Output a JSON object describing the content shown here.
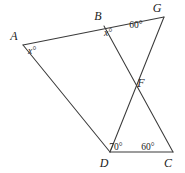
{
  "figure": {
    "background_color": "#ffffff",
    "stroke_color": "#3a3a3a",
    "text_color": "#222222",
    "width": 185,
    "height": 173
  },
  "points": {
    "A": {
      "label": "A",
      "x": 23,
      "y": 45,
      "label_x": 14,
      "label_y": 40
    },
    "B": {
      "label": "B",
      "x": 104,
      "y": 26,
      "label_x": 98,
      "label_y": 20
    },
    "G": {
      "label": "G",
      "x": 164,
      "y": 17,
      "label_x": 157,
      "label_y": 12
    },
    "F": {
      "label": "F",
      "x": 137,
      "y": 82,
      "label_x": 141,
      "label_y": 87
    },
    "D": {
      "label": "D",
      "x": 110,
      "y": 152,
      "label_x": 104,
      "label_y": 167
    },
    "C": {
      "label": "C",
      "x": 173,
      "y": 152,
      "label_x": 168,
      "label_y": 167
    }
  },
  "segments": [
    {
      "name": "segment-A-G",
      "from": "A",
      "to": "G",
      "note": "passes through B"
    },
    {
      "name": "segment-A-D",
      "from": "A",
      "to": "D"
    },
    {
      "name": "segment-B-C",
      "from": "B",
      "to": "C",
      "note": "passes through F"
    },
    {
      "name": "segment-G-D",
      "from": "G",
      "to": "D",
      "note": "passes through F"
    },
    {
      "name": "segment-D-C",
      "from": "D",
      "to": "C"
    }
  ],
  "angles": [
    {
      "name": "angle-at-A",
      "vertex": "A",
      "text": "x°",
      "variable": true,
      "x": 32,
      "y": 54
    },
    {
      "name": "angle-at-B",
      "vertex": "B",
      "text": "x°",
      "variable": true,
      "x": 108,
      "y": 36
    },
    {
      "name": "angle-at-G",
      "vertex": "G",
      "text": "60°",
      "variable": false,
      "x": 136,
      "y": 28
    },
    {
      "name": "angle-at-D",
      "vertex": "D",
      "text": "70°",
      "variable": false,
      "x": 116,
      "y": 150
    },
    {
      "name": "angle-at-C",
      "vertex": "C",
      "text": "60°",
      "variable": false,
      "x": 148,
      "y": 150
    }
  ]
}
